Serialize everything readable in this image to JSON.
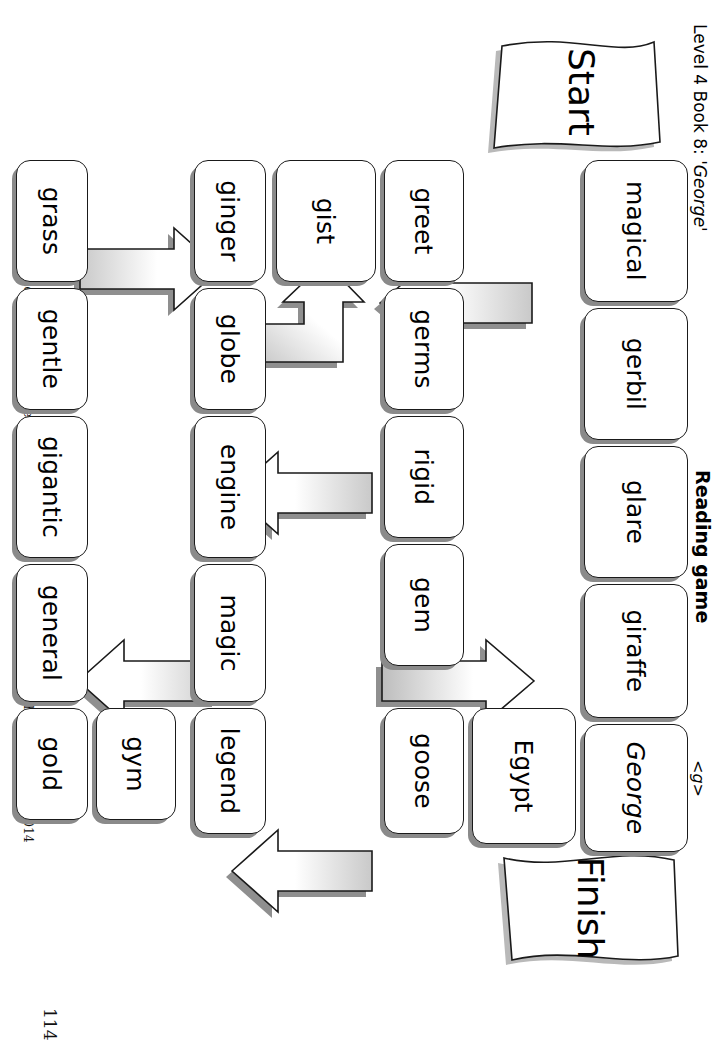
{
  "page": {
    "page_number": "114",
    "level_line_prefix": "Level 4 Book 8: ",
    "level_line_book": "'George'",
    "title": "Reading game",
    "grapheme": "<g>",
    "footer": "Play with counters and die. This sheet may be photocopied by the purchaser.  © Phonic Books Ltd 2014"
  },
  "board": {
    "start_label": "Start",
    "finish_label": "Finish",
    "rows": [
      {
        "cells": [
          "grass",
          "gentle",
          "gigantic",
          "general",
          "gold"
        ]
      },
      {
        "cells": [
          "ginger",
          "globe",
          "engine",
          "magic",
          "legend",
          "gym"
        ]
      },
      {
        "cells": [
          "gist"
        ]
      },
      {
        "cells": [
          "greet",
          "germs",
          "rigid",
          "gem",
          "goose",
          "Egypt"
        ]
      },
      {
        "cells": [
          "magical",
          "gerbil",
          "glare",
          "giraffe",
          "George"
        ]
      }
    ],
    "words": [
      "grass",
      "gentle",
      "gigantic",
      "general",
      "gold",
      "ginger",
      "globe",
      "engine",
      "magic",
      "legend",
      "gym",
      "gist",
      "greet",
      "germs",
      "rigid",
      "gem",
      "goose",
      "Egypt",
      "magical",
      "gerbil",
      "glare",
      "giraffe",
      "George"
    ],
    "arrows": [
      {
        "name": "gentle-to-globe",
        "from": "gentle",
        "to": "globe",
        "direction": "up"
      },
      {
        "name": "magic-to-general",
        "from": "magic",
        "to": "general",
        "direction": "down"
      },
      {
        "name": "globe-to-gist",
        "from": "globe",
        "to": "gist",
        "direction": "up-then-left"
      },
      {
        "name": "rigid-to-engine",
        "from": "rigid",
        "to": "engine",
        "direction": "down"
      },
      {
        "name": "goose-to-legend",
        "from": "goose",
        "to": "legend",
        "direction": "down"
      },
      {
        "name": "gem-to-giraffe",
        "from": "gem",
        "to": "giraffe",
        "direction": "up"
      },
      {
        "name": "gerbil-to-germs",
        "from": "gerbil",
        "to": "germs",
        "direction": "down"
      }
    ],
    "colors": {
      "cell_border": "#1a1a1a",
      "cell_fill": "#ffffff",
      "cell_shadow": "#8a8a8a",
      "arrow_outline": "#1a1a1a",
      "arrow_shadow": "#808080"
    }
  }
}
